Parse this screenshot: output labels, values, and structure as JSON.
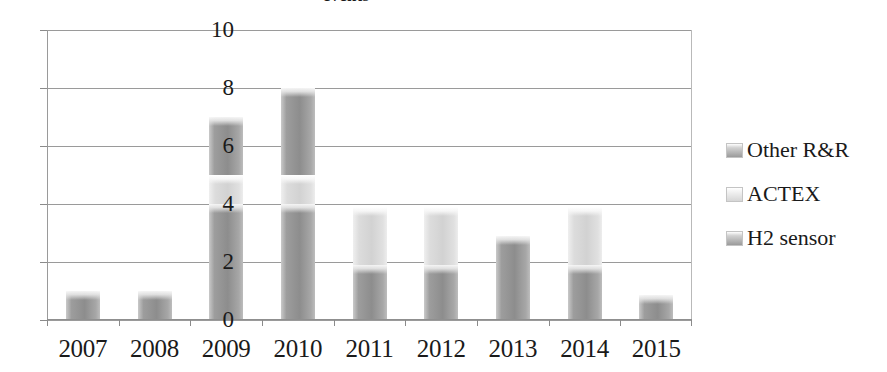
{
  "chart_data": {
    "type": "bar",
    "subtype": "stacked-vertical",
    "title": "events",
    "xlabel": "",
    "ylabel": "",
    "ylim": [
      0,
      10
    ],
    "y_ticks": [
      0,
      2,
      4,
      6,
      8,
      10
    ],
    "grid": true,
    "legend_position": "right",
    "categories": [
      "2007",
      "2008",
      "2009",
      "2010",
      "2011",
      "2012",
      "2013",
      "2014",
      "2015"
    ],
    "series": [
      {
        "name": "Other R&R",
        "color": "#8d8d8d",
        "swatch": "sw-dark",
        "values": [
          0,
          0,
          2,
          3,
          0,
          0,
          0,
          0,
          0
        ]
      },
      {
        "name": "ACTEX",
        "color": "#d2d2d2",
        "swatch": "sw-light",
        "values": [
          0,
          0,
          1,
          1,
          2,
          2,
          0,
          2,
          0
        ]
      },
      {
        "name": "H2 sensor",
        "color": "#8d8d8d",
        "swatch": "sw-dark",
        "values": [
          1,
          1,
          4,
          4,
          1.9,
          1.9,
          2.9,
          1.9,
          0.85
        ]
      }
    ],
    "totals": [
      1,
      1,
      7,
      8,
      3.9,
      3.9,
      2.9,
      3.9,
      0.85
    ]
  },
  "legend": {
    "items": [
      {
        "label": "Other R&R",
        "swatch": "sw-dark"
      },
      {
        "label": "ACTEX",
        "swatch": "sw-light"
      },
      {
        "label": "H2 sensor",
        "swatch": "sw-dark"
      }
    ]
  },
  "axis": {
    "y_tick_labels": [
      "10",
      "8",
      "6",
      "4",
      "2",
      "0"
    ]
  }
}
